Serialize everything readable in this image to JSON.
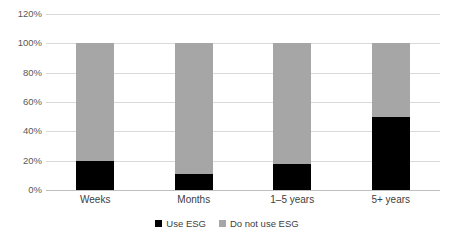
{
  "chart_data": {
    "type": "bar",
    "subtype": "stacked-100-percent",
    "title": "",
    "subtitle": "",
    "xlabel": "",
    "ylabel": "",
    "categories": [
      "Weeks",
      "Months",
      "1–5 years",
      "5+ years"
    ],
    "series": [
      {
        "name": "Use ESG",
        "color": "#000000",
        "values": [
          20,
          11,
          18,
          50
        ]
      },
      {
        "name": "Do not use ESG",
        "color": "#a6a6a6",
        "values": [
          80,
          89,
          82,
          50
        ]
      }
    ],
    "ylim": [
      0,
      120
    ],
    "ytick_values": [
      0,
      20,
      40,
      60,
      80,
      100,
      120
    ],
    "ytick_labels": [
      "0%",
      "20%",
      "40%",
      "60%",
      "80%",
      "100%",
      "120%"
    ],
    "grid": true,
    "grid_color": "#d9d9d9",
    "axis_color": "#bfbfbf",
    "legend_position": "bottom",
    "legend_entries": [
      "Use ESG",
      "Do not use ESG"
    ],
    "background": "#ffffff",
    "tick_label_color": "#595959",
    "category_label_color": "#404040"
  }
}
